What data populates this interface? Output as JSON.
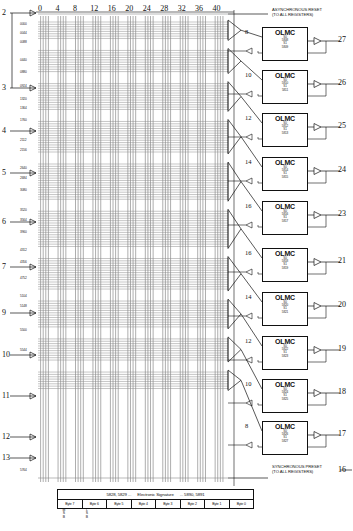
{
  "diagram": {
    "type": "pld-fuse-map",
    "column_axis": {
      "label": "product term input line numbers",
      "ticks": [
        "0",
        "4",
        "8",
        "12",
        "16",
        "20",
        "24",
        "28",
        "32",
        "36",
        "40"
      ],
      "tick_step": 4,
      "total_columns": 44
    },
    "notes": {
      "async_reset": "ASYNCHRONOUS RESET\n(TO ALL REGISTERS)",
      "async_reset_line1": "ASYNCHRONOUS RESET",
      "async_reset_line2": "(TO ALL REGISTERS)",
      "sync_preset_line1": "SYNCHRONOUS PRESET",
      "sync_preset_line2": "(TO ALL REGISTERS)"
    },
    "left_pins": [
      {
        "num": "2",
        "y": 13
      },
      {
        "num": "3",
        "y": 88
      },
      {
        "num": "4",
        "y": 131
      },
      {
        "num": "5",
        "y": 173
      },
      {
        "num": "6",
        "y": 222
      },
      {
        "num": "7",
        "y": 267
      },
      {
        "num": "9",
        "y": 313
      },
      {
        "num": "10",
        "y": 355
      },
      {
        "num": "11",
        "y": 396
      },
      {
        "num": "12",
        "y": 437
      },
      {
        "num": "13",
        "y": 458
      }
    ],
    "right_pins": [
      "27",
      "26",
      "25",
      "24",
      "23",
      "21",
      "20",
      "19",
      "18",
      "17",
      "16"
    ],
    "olmc_blocks": [
      {
        "pin": "27",
        "terms": "8",
        "s0": "S0",
        "s0_fuse": "5808",
        "s1": "S1",
        "s1_fuse": "5809"
      },
      {
        "pin": "26",
        "terms": "10",
        "s0": "S0",
        "s0_fuse": "5810",
        "s1": "S1",
        "s1_fuse": "5811"
      },
      {
        "pin": "25",
        "terms": "12",
        "s0": "S0",
        "s0_fuse": "5812",
        "s1": "S1",
        "s1_fuse": "5813"
      },
      {
        "pin": "24",
        "terms": "14",
        "s0": "S0",
        "s0_fuse": "5814",
        "s1": "S1",
        "s1_fuse": "5815"
      },
      {
        "pin": "23",
        "terms": "16",
        "s0": "S0",
        "s0_fuse": "5816",
        "s1": "S1",
        "s1_fuse": "5817"
      },
      {
        "pin": "21",
        "terms": "16",
        "s0": "S0",
        "s0_fuse": "5818",
        "s1": "S1",
        "s1_fuse": "5819"
      },
      {
        "pin": "20",
        "terms": "14",
        "s0": "S0",
        "s0_fuse": "5820",
        "s1": "S1",
        "s1_fuse": "5821"
      },
      {
        "pin": "19",
        "terms": "12",
        "s0": "S0",
        "s0_fuse": "5822",
        "s1": "S1",
        "s1_fuse": "5823"
      },
      {
        "pin": "18",
        "terms": "10",
        "s0": "S0",
        "s0_fuse": "5824",
        "s1": "S1",
        "s1_fuse": "5825"
      },
      {
        "pin": "17",
        "terms": "8",
        "s0": "S0",
        "s0_fuse": "5826",
        "s1": "S1",
        "s1_fuse": "5827"
      }
    ],
    "row_addresses": [
      "0000",
      "0044",
      "0088",
      "0440",
      "0880",
      "0924",
      "1320",
      "1364",
      "1760",
      "2112",
      "2156",
      "2640",
      "2684",
      "3080",
      "3520",
      "3564",
      "3960",
      "4312",
      "4356",
      "4752",
      "5104",
      "5148",
      "5500",
      "5544",
      "5764"
    ],
    "olmc_label": "OLMC",
    "signature": {
      "header_left": "5828, 5829 ...",
      "header_center": "Electronic Signature",
      "header_right": "... 5890, 5891",
      "bytes": [
        "Byte 7",
        "Byte 6",
        "Byte 5",
        "Byte 4",
        "Byte 3",
        "Byte 2",
        "Byte 1",
        "Byte 0"
      ],
      "msb_label": "M\nS\nB",
      "lsb_label": "L\nS\nB",
      "msb_chars": [
        "M",
        "S",
        "B"
      ],
      "lsb_chars": [
        "L",
        "S",
        "B"
      ]
    },
    "colors": {
      "ink": "#111111",
      "array_line": "#6a6a6a",
      "row_line": "#8c8c8c",
      "background": "#ffffff"
    }
  }
}
